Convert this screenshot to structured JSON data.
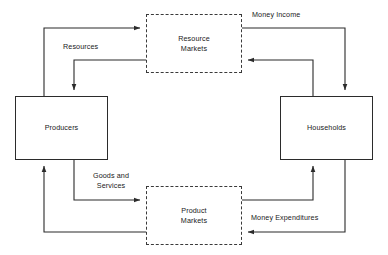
{
  "diagram": {
    "type": "circular-flow",
    "nodes": {
      "producers": {
        "label": "Producers",
        "style": "solid"
      },
      "households": {
        "label": "Households",
        "style": "solid"
      },
      "resource_markets": {
        "label": "Resource\nMarkets",
        "style": "dashed"
      },
      "product_markets": {
        "label": "Product\nMarkets",
        "style": "dashed"
      }
    },
    "edges": {
      "resources": {
        "label": "Resources",
        "from": "producers",
        "to": "resource_markets"
      },
      "money_income": {
        "label": "Money Income",
        "from": "resource_markets",
        "to": "households"
      },
      "goods_and_services": {
        "label": "Goods and\nServices",
        "from": "producers",
        "to": "product_markets"
      },
      "money_expenditures": {
        "label": "Money Expenditures",
        "from": "households",
        "to": "product_markets"
      }
    },
    "colors": {
      "line": "#2b2b2b",
      "dashed_line": "#3a3a3a",
      "text": "#1a1a1a",
      "background": "#ffffff"
    }
  }
}
